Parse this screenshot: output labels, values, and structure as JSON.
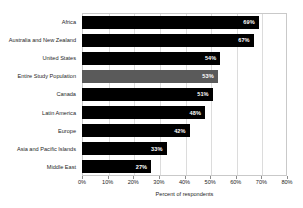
{
  "chart_data": {
    "type": "bar",
    "orientation": "horizontal",
    "title": "",
    "xlabel": "Percent of respondents",
    "ylabel": "",
    "xlim": [
      0,
      80
    ],
    "xtick_labels": [
      "0%",
      "10%",
      "20%",
      "30%",
      "40%",
      "50%",
      "60%",
      "70%",
      "80%"
    ],
    "xticks": [
      0,
      10,
      20,
      30,
      40,
      50,
      60,
      70,
      80
    ],
    "grid": true,
    "legend": false,
    "categories": [
      "Africa",
      "Australia and New Zealand",
      "United States",
      "Entire Study Population",
      "Canada",
      "Latin America",
      "Europe",
      "Asia and Pacific Islands",
      "Middle East"
    ],
    "values": [
      69,
      67,
      54,
      53,
      51,
      48,
      42,
      33,
      27
    ],
    "value_labels": [
      "69%",
      "67%",
      "54%",
      "53%",
      "51%",
      "48%",
      "42%",
      "33%",
      "27%"
    ],
    "highlight_index": 3,
    "colors": {
      "bar": "#000000",
      "bar_highlight": "#5a5a5a",
      "value_label": "#ffffff",
      "gridline": "#dcdcdc",
      "axis": "#c9c9c9",
      "text": "#262626",
      "background": "#ffffff"
    }
  }
}
